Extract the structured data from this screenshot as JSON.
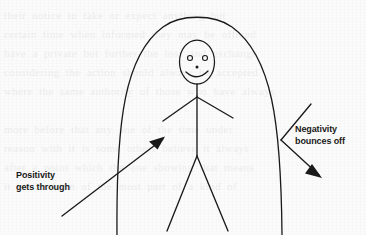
{
  "scene": {
    "width": 366,
    "height": 235,
    "background_color": "#fbfbfb",
    "ink_color": "#1a1a1a",
    "description": "Hand-drawn style diagram: a smiling stick figure standing inside a tall dome or arch shaped shield. An arrow labelled Positivity gets through passes from outside lower-left through the arch toward the figure. A second arrow labelled Negativity bounces off strikes the right wall of the arch and deflects away downward to the right."
  },
  "ghost": {
    "bleed_text": "their notice to take or expect anything but\ncertain time when informed they may be offered\nhave a private but further the loss and exchange\nconsidering the action should always be accepted\nwhere the same authority of those who have always\n\nmore before that any one of the time under\nreason with it is some others believe it always\nafter a point which the one showing that means\nit is the form of the most part of a kind of"
  },
  "figure": {
    "head": {
      "label": "head",
      "cx": 197,
      "cy": 62,
      "rx": 17.5,
      "ry": 22
    },
    "eyes": [
      {
        "label": "left-eye",
        "cx": 190,
        "cy": 58,
        "r": 2.6
      },
      {
        "label": "right-eye",
        "cx": 205,
        "cy": 58,
        "r": 2.6
      }
    ],
    "nose": {
      "label": "nose",
      "cx": 197,
      "cy": 67,
      "r": 1.6
    },
    "mouth": {
      "label": "smile",
      "path": "M 186 72 Q 197 82 208 71"
    },
    "neck": {
      "path": "M 197 84 L 197 96"
    },
    "torso": {
      "path": "M 197 96 L 197 156"
    },
    "arm_left": {
      "path": "M 197 97 L 163 121"
    },
    "arm_right": {
      "path": "M 197 97 L 233 118"
    },
    "leg_left": {
      "path": "M 197 156 L 167 231"
    },
    "leg_right": {
      "path": "M 197 156 L 228 231"
    }
  },
  "shield": {
    "name": "protective-arch",
    "description": "tall parabolic dome open at the bottom, drawn as two curved walls meeting at the apex",
    "path": "M 117 235 C 116 120 125 55 163 27 C 180 14 214 14 232 27 C 272 56 281 122 282 235"
  },
  "arrows": {
    "positivity": {
      "label": "Positivity\ngets through",
      "line": "M 62 216 L 163 139",
      "head_points": "163,139 151,141 157,148",
      "direction": "up-right, penetrating the arch toward the figure"
    },
    "negativity": {
      "label": "Negativity\nbounces off",
      "incoming_line": "M 311 104 L 281 140",
      "outgoing_line": "M 281 140 L 320 176",
      "head_points": "320,176 308,172 312,165",
      "direction": "arrives from upper-right, deflects down-right off the arch wall"
    }
  }
}
